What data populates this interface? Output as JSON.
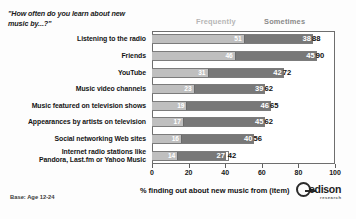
{
  "chart_data": {
    "type": "bar",
    "subtype": "horizontal-stacked-bar",
    "title": "\"How often do you learn about new music by...?\"",
    "xlabel": "% finding out about new music from (item)",
    "ylabel": "",
    "xlim": [
      0,
      100
    ],
    "xticks": [
      0,
      20,
      40,
      60,
      80,
      100
    ],
    "grid": false,
    "legend_position": "top",
    "categories": [
      "Listening to the radio",
      "Friends",
      "YouTube",
      "Music video channels",
      "Music featured on television shows",
      "Appearances by artists on television",
      "Social networking Web sites",
      "Internet radio stations like Pandora, Last.fm or Yahoo Music"
    ],
    "series": [
      {
        "name": "Frequently",
        "color": "#bfbfbf",
        "values": [
          51,
          46,
          31,
          23,
          19,
          17,
          16,
          14
        ]
      },
      {
        "name": "Sometimes",
        "color": "#787878",
        "values": [
          38,
          45,
          42,
          39,
          46,
          45,
          40,
          27
        ]
      }
    ],
    "totals": [
      88,
      90,
      72,
      62,
      65,
      62,
      56,
      42
    ],
    "footnote": "Base: Age 12-24"
  },
  "rows": [
    {
      "label_line1": "Listening to the radio",
      "label_line2": "",
      "frequently": 51,
      "sometimes": 38,
      "total": 88
    },
    {
      "label_line1": "Friends",
      "label_line2": "",
      "frequently": 46,
      "sometimes": 45,
      "total": 90
    },
    {
      "label_line1": "YouTube",
      "label_line2": "",
      "frequently": 31,
      "sometimes": 42,
      "total": 72
    },
    {
      "label_line1": "Music video channels",
      "label_line2": "",
      "frequently": 23,
      "sometimes": 39,
      "total": 62
    },
    {
      "label_line1": "Music featured on television shows",
      "label_line2": "",
      "frequently": 19,
      "sometimes": 46,
      "total": 65
    },
    {
      "label_line1": "Appearances by artists on television",
      "label_line2": "",
      "frequently": 17,
      "sometimes": 45,
      "total": 62
    },
    {
      "label_line1": "Social networking Web sites",
      "label_line2": "",
      "frequently": 16,
      "sometimes": 40,
      "total": 56
    },
    {
      "label_line1": "Internet radio stations like",
      "label_line2": "Pandora, Last.fm or Yahoo Music",
      "frequently": 14,
      "sometimes": 27,
      "total": 42
    }
  ],
  "legend": {
    "frequently": "Frequently",
    "sometimes": "Sometimes"
  },
  "axis": {
    "tick_labels": [
      "0",
      "20",
      "40",
      "60",
      "80",
      "100"
    ],
    "caption": "% finding out about new music from (item)"
  },
  "footer": {
    "base_note": "Base: Age 12-24"
  },
  "brand": {
    "name": "edison",
    "tagline": "research"
  },
  "colors": {
    "frequently": "#bfbfbf",
    "sometimes": "#787878",
    "frame": "#6e6e6e",
    "text": "#141414"
  }
}
